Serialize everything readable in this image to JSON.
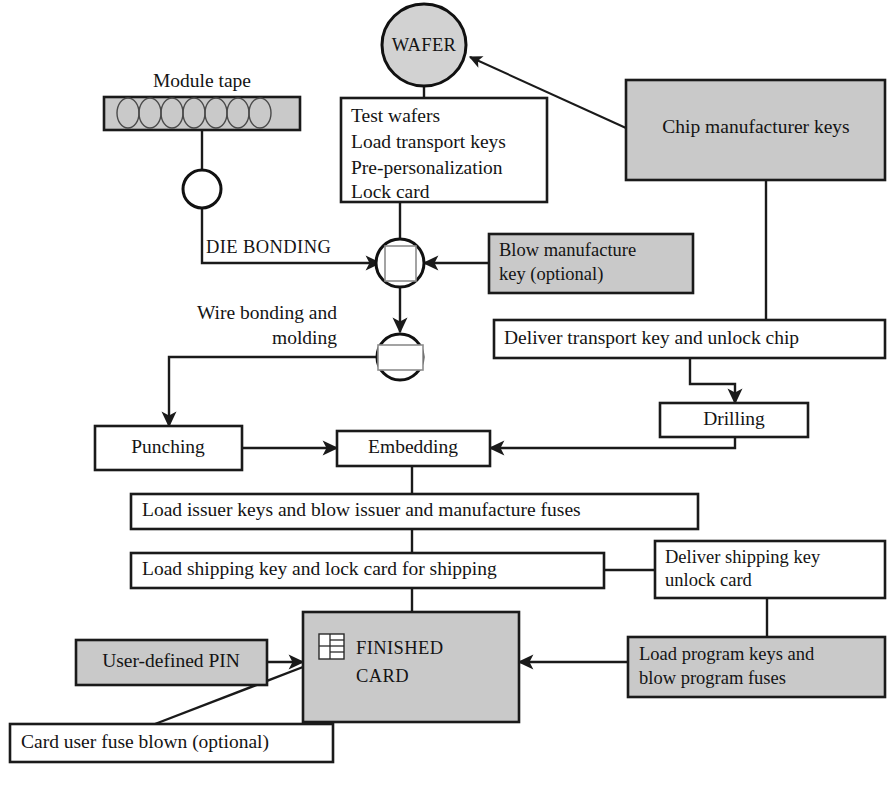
{
  "diagram": {
    "colors": {
      "fill_gray": "#c9c9c9",
      "fill_white": "#ffffff",
      "stroke": "#1a1a1a",
      "text": "#141414"
    }
  },
  "nodes": {
    "wafer": {
      "label": "WAFER",
      "shape": "ellipse",
      "fill": "gray"
    },
    "module_tape_caption": {
      "label": "Module tape"
    },
    "module_tape": {
      "shape": "tape",
      "fill": "gray"
    },
    "tape_reel": {
      "shape": "ellipse",
      "fill": "white"
    },
    "test_wafers": {
      "lines": [
        "Test wafers",
        "Load transport keys",
        "Pre-personalization",
        "Lock card"
      ],
      "fill": "white"
    },
    "chip_manufacturer_keys": {
      "label": "Chip manufacturer keys",
      "fill": "gray"
    },
    "die_bonding_caption": {
      "label": "DIE BONDING"
    },
    "die_bond_chip": {
      "shape": "ellipse-with-square",
      "fill": "white"
    },
    "blow_manufacture_key": {
      "lines": [
        "Blow manufacture",
        "key (optional)"
      ],
      "fill": "gray"
    },
    "wire_bonding_caption": {
      "lines": [
        "Wire bonding and",
        "molding"
      ]
    },
    "wire_bond_chip": {
      "shape": "ellipse-with-rect",
      "fill": "white"
    },
    "deliver_transport_key": {
      "label": "Deliver transport key and unlock chip",
      "fill": "white"
    },
    "drilling": {
      "label": "Drilling",
      "fill": "white"
    },
    "punching": {
      "label": "Punching",
      "fill": "white"
    },
    "embedding": {
      "label": "Embedding",
      "fill": "white"
    },
    "load_issuer_keys": {
      "label": "Load issuer keys and blow issuer and manufacture fuses",
      "fill": "white"
    },
    "load_shipping_key": {
      "label": "Load shipping key and lock card for shipping",
      "fill": "white"
    },
    "deliver_shipping_key": {
      "lines": [
        "Deliver shipping key",
        "unlock card"
      ],
      "fill": "white"
    },
    "finished_card": {
      "lines": [
        "FINISHED",
        "CARD"
      ],
      "fill": "gray",
      "icon": "chip-contact-pad-icon"
    },
    "user_defined_pin": {
      "label": "User-defined PIN",
      "fill": "gray"
    },
    "load_program_keys": {
      "lines": [
        "Load program keys and",
        "blow program fuses"
      ],
      "fill": "gray"
    },
    "card_user_fuse_blown": {
      "label": "Card user fuse blown (optional)",
      "fill": "white"
    }
  },
  "edges": [
    {
      "from": "chip_manufacturer_keys",
      "to": "wafer",
      "arrow": true
    },
    {
      "from": "wafer",
      "to": "test_wafers",
      "arrow": false
    },
    {
      "from": "module_tape",
      "to": "tape_reel",
      "arrow": false
    },
    {
      "from": "tape_reel",
      "to": "die_bond_chip",
      "arrow": true,
      "label": "DIE BONDING"
    },
    {
      "from": "test_wafers",
      "to": "die_bond_chip",
      "arrow": false
    },
    {
      "from": "blow_manufacture_key",
      "to": "die_bond_chip",
      "arrow": true
    },
    {
      "from": "die_bond_chip",
      "to": "wire_bond_chip",
      "arrow": true
    },
    {
      "from": "wire_bond_chip",
      "to": "punching",
      "arrow": true
    },
    {
      "from": "chip_manufacturer_keys",
      "to": "deliver_transport_key",
      "arrow": false
    },
    {
      "from": "deliver_transport_key",
      "to": "drilling",
      "arrow": true
    },
    {
      "from": "punching",
      "to": "embedding",
      "arrow": true
    },
    {
      "from": "drilling",
      "to": "embedding",
      "arrow": true
    },
    {
      "from": "embedding",
      "to": "load_issuer_keys",
      "arrow": false
    },
    {
      "from": "load_issuer_keys",
      "to": "load_shipping_key",
      "arrow": false
    },
    {
      "from": "load_shipping_key",
      "to": "deliver_shipping_key",
      "arrow": false
    },
    {
      "from": "load_shipping_key",
      "to": "finished_card",
      "arrow": false
    },
    {
      "from": "deliver_shipping_key",
      "to": "load_program_keys",
      "arrow": false
    },
    {
      "from": "user_defined_pin",
      "to": "finished_card",
      "arrow": true
    },
    {
      "from": "load_program_keys",
      "to": "finished_card",
      "arrow": true
    },
    {
      "from": "card_user_fuse_blown",
      "to": "finished_card",
      "arrow": false
    }
  ]
}
